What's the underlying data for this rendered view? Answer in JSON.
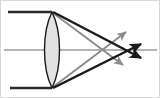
{
  "figure": {
    "type": "optics-ray-diagram",
    "width": 160,
    "height": 98,
    "background_color": "#ffffff",
    "border_color": "#d8d8d8"
  },
  "colors": {
    "ray_primary": "#1a1a1a",
    "ray_secondary": "#8c8c8c",
    "axis": "#6b6b6b",
    "lens_fill": "#e2e2e2",
    "lens_stroke": "#1a1a1a",
    "incoming_ray": "#2b2b2b"
  },
  "lens": {
    "name": "biconvex-converging-lens",
    "center_x": 52,
    "top_vertex_y": 12,
    "bottom_vertex_y": 88,
    "half_width": 14,
    "fill": "#e2e2e2",
    "stroke": "#1a1a1a",
    "stroke_width": 1.4,
    "path": "M 52 12 C 42 32 42 68 52 88 C 62 68 62 32 52 12 Z"
  },
  "optical_axis": {
    "name": "optical-axis",
    "x1": 4,
    "y1": 50,
    "x2": 157,
    "y2": 50,
    "color": "#6b6b6b",
    "stroke_width": 1.1
  },
  "incoming_rays": [
    {
      "name": "incoming-ray-top",
      "x1": 8,
      "y1": 12,
      "x2": 52,
      "y2": 12,
      "color": "#2b2b2b",
      "stroke_width": 2.6
    },
    {
      "name": "incoming-ray-bottom",
      "x1": 10,
      "y1": 88,
      "x2": 52,
      "y2": 88,
      "color": "#2b2b2b",
      "stroke_width": 2.6
    }
  ],
  "refracted_rays": [
    {
      "name": "refracted-ray-top-to-lower-focus",
      "from": "lens-top-vertex",
      "x1": 53,
      "y1": 12,
      "x2": 141,
      "y2": 58,
      "color": "#1a1a1a",
      "stroke_width": 2.4,
      "arrow": true,
      "arrow_direction": "down-right"
    },
    {
      "name": "refracted-ray-bottom-to-upper-focus",
      "from": "lens-bottom-vertex",
      "x1": 53,
      "y1": 88,
      "x2": 141,
      "y2": 44,
      "color": "#1a1a1a",
      "stroke_width": 2.4,
      "arrow": true,
      "arrow_direction": "up-right"
    },
    {
      "name": "refracted-ray-top-secondary",
      "from": "lens-top-vertex",
      "x1": 53,
      "y1": 13,
      "x2": 123,
      "y2": 65,
      "color": "#8c8c8c",
      "stroke_width": 2.0,
      "arrow": true,
      "arrow_direction": "down-right"
    },
    {
      "name": "refracted-ray-bottom-secondary",
      "from": "lens-bottom-vertex",
      "x1": 53,
      "y1": 87,
      "x2": 126,
      "y2": 32,
      "color": "#8c8c8c",
      "stroke_width": 2.0,
      "arrow": true,
      "arrow_direction": "up-right"
    }
  ],
  "focal_region": {
    "name": "focal-crossing-point",
    "x": 133,
    "y": 50,
    "description": "rays converge near the focal point on the optical axis"
  }
}
